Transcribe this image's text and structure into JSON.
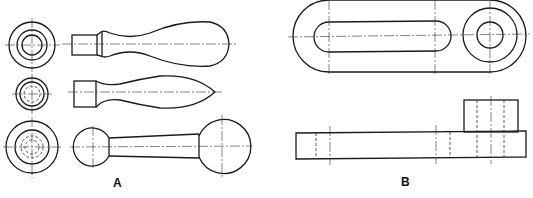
{
  "labels": {
    "part_a": "A",
    "part_b": "B"
  },
  "figure": {
    "part_a": {
      "description": "Three handle variants, each with end view and side view",
      "items": [
        "tapered bulb handle",
        "spindle handle with pointed tip",
        "ball-end crank handle"
      ]
    },
    "part_b": {
      "description": "Slotted link lever with boss, top view and front view",
      "views": [
        "top view",
        "front view"
      ]
    }
  },
  "colors": {
    "line": "#1a1a1a",
    "background": "#ffffff"
  }
}
